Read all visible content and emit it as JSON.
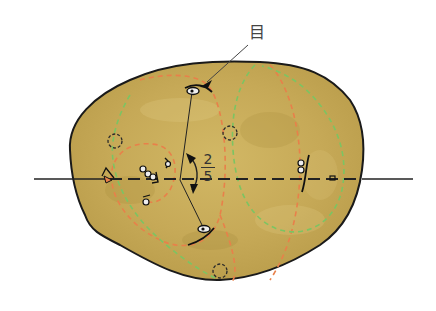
{
  "diagram": {
    "labels": {
      "eye": "目",
      "fraction_numerator": "2",
      "fraction_denominator": "5"
    },
    "colors": {
      "potato_fill": "#c9ad58",
      "potato_outline": "#1a1a1a",
      "orange_dashed": "#e8804a",
      "green_dashed": "#7cc462",
      "axis_line": "#222222",
      "eye_circle": "#2a2a2a"
    },
    "elements": {
      "horizontal_axis": "solid line with dashed segment across potato",
      "eye_marks": 6,
      "dotted_circles": 4,
      "orange_spiral_curves": 2,
      "green_spiral_curves": 2
    }
  }
}
